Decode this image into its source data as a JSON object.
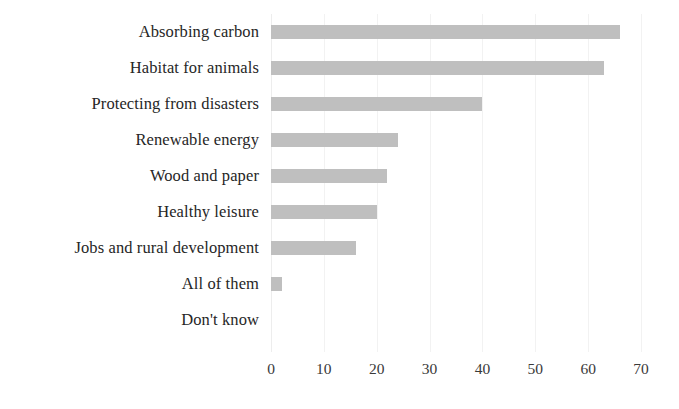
{
  "chart_data": {
    "type": "bar",
    "orientation": "horizontal",
    "title": "",
    "subtitle": "",
    "xlabel": "",
    "ylabel": "",
    "xlim": [
      0,
      70
    ],
    "ylim": null,
    "grid": true,
    "legend": false,
    "legend_position": "none",
    "xticks": [
      0,
      10,
      20,
      30,
      40,
      50,
      60,
      70
    ],
    "xtick_labels": [
      "0",
      "10",
      "20",
      "30",
      "40",
      "50",
      "60",
      "70"
    ],
    "categories": [
      "Absorbing carbon",
      "Habitat for animals",
      "Protecting from disasters",
      "Renewable energy",
      "Wood and paper",
      "Healthy leisure",
      "Jobs and rural development",
      "All of them",
      "Don't know"
    ],
    "values": [
      66,
      63,
      40,
      24,
      22,
      20,
      16,
      2,
      0
    ],
    "bar_color": "#bfbfbf",
    "background_color": "#ffffff",
    "grid_color": "#f2f2f2",
    "text_color": "#262626"
  }
}
